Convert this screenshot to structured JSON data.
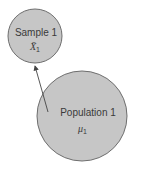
{
  "diagram": {
    "sample": {
      "label": "Sample 1",
      "symbol": "X̄",
      "subscript": "1",
      "fill": "#c6c6c6",
      "stroke": "#6e6e6e"
    },
    "population": {
      "label": "Population 1",
      "symbol": "μ",
      "subscript": "1",
      "fill": "#c6c6c6",
      "stroke": "#6e6e6e"
    },
    "arrow": {
      "from": "population",
      "to": "sample",
      "color": "#444444"
    }
  }
}
